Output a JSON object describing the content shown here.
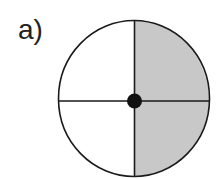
{
  "figure": {
    "label": "a)",
    "circle": {
      "divisions": 4,
      "shaded_quadrants": [
        "top-right",
        "bottom-right"
      ],
      "shaded_fraction": "2/4",
      "colors": {
        "shade": "#c8c8c8",
        "unshaded": "#ffffff",
        "stroke": "#1a1a1a",
        "center_dot": "#111111"
      }
    }
  }
}
